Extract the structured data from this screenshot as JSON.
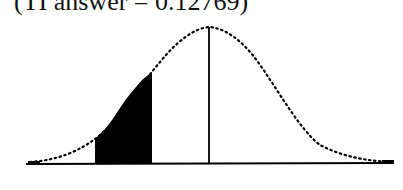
{
  "caption": "(TI answer = 0.12769)",
  "diagram": {
    "type": "normal-distribution-curve",
    "shaded_region": {
      "side": "left of mean",
      "description": "area between two x-values below the mean",
      "fill_color": "#000000"
    },
    "mean_line": true,
    "curve_style": "dotted",
    "colors": {
      "stroke": "#000000",
      "background": "#ffffff"
    }
  }
}
